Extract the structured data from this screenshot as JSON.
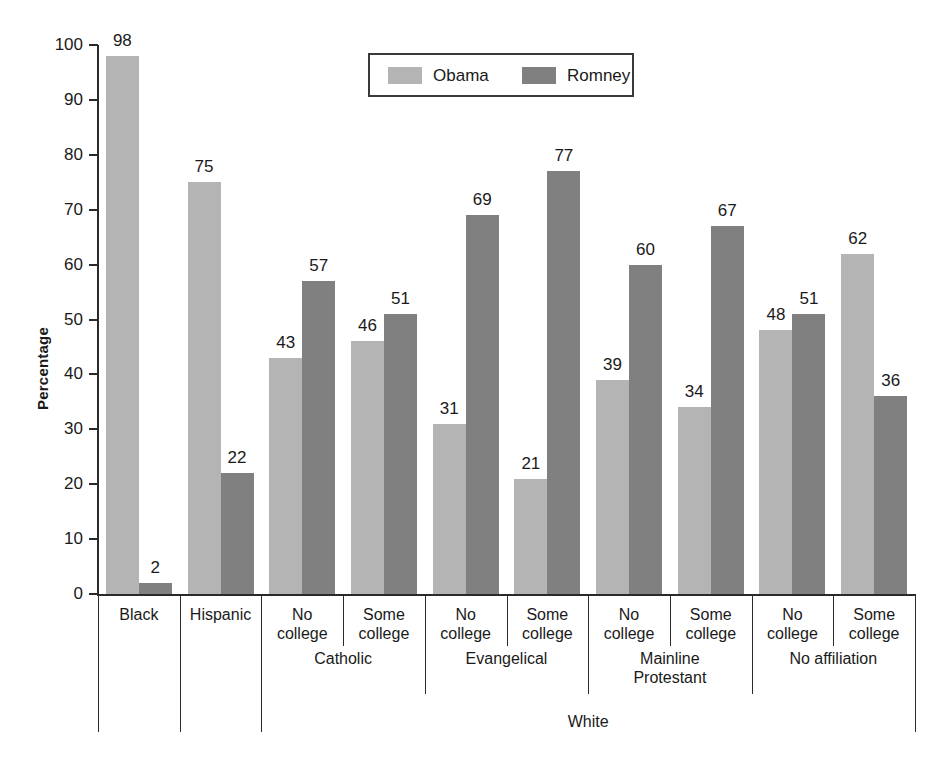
{
  "chart_data": {
    "type": "bar",
    "title": "",
    "subtitle": "",
    "xlabel": "",
    "ylabel": "Percentage",
    "ylim": [
      0,
      100
    ],
    "ytick_values": [
      0,
      10,
      20,
      30,
      40,
      50,
      60,
      70,
      80,
      90,
      100
    ],
    "ytick_labels": [
      "0",
      "10",
      "20",
      "30",
      "40",
      "50",
      "60",
      "70",
      "80",
      "90",
      "100"
    ],
    "grid": false,
    "legend_position": "top-center",
    "categories": [
      "Black",
      "Hispanic",
      "No college",
      "Some college",
      "No college",
      "Some college",
      "No college",
      "Some college",
      "No college",
      "Some college"
    ],
    "series": [
      {
        "name": "Obama",
        "color": "#b4b4b4",
        "values": [
          98,
          75,
          43,
          46,
          31,
          21,
          39,
          34,
          48,
          62
        ]
      },
      {
        "name": "Romney",
        "color": "#808080",
        "values": [
          2,
          22,
          57,
          51,
          69,
          77,
          60,
          67,
          51,
          36
        ]
      }
    ],
    "group_levels": [
      {
        "name": "religion",
        "groups": [
          {
            "label": "",
            "span": [
              0,
              0
            ]
          },
          {
            "label": "",
            "span": [
              1,
              1
            ]
          },
          {
            "label": "Catholic",
            "span": [
              2,
              3
            ]
          },
          {
            "label": "Evangelical",
            "span": [
              4,
              5
            ]
          },
          {
            "label": "Mainline\nProtestant",
            "span": [
              6,
              7
            ]
          },
          {
            "label": "No affiliation",
            "span": [
              8,
              9
            ]
          }
        ]
      },
      {
        "name": "race",
        "groups": [
          {
            "label": "White",
            "span": [
              2,
              9
            ]
          }
        ]
      }
    ]
  },
  "legend": {
    "items": [
      {
        "label": "Obama",
        "color": "#b4b4b4"
      },
      {
        "label": "Romney",
        "color": "#808080"
      }
    ]
  },
  "axis": {
    "y_title": "Percentage"
  },
  "group_labels": {
    "catholic": "Catholic",
    "evangelical": "Evangelical",
    "mainline": "Mainline",
    "protestant": "Protestant",
    "no_affiliation": "No affiliation",
    "white": "White"
  },
  "category_labels": {
    "black": "Black",
    "hispanic": "Hispanic",
    "no_line1": "No",
    "no_line2": "college",
    "some_line1": "Some",
    "some_line2": "college"
  }
}
